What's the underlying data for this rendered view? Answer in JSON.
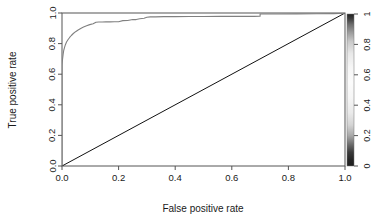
{
  "figure": {
    "kind": "roc-curve-plot",
    "background": "#ffffff",
    "width": 387,
    "height": 221
  },
  "axes": {
    "xlabel": "False positive rate",
    "ylabel": "True positive rate",
    "xticks": [
      "0.0",
      "0.2",
      "0.4",
      "0.6",
      "0.8",
      "1.0"
    ],
    "yticks": [
      "0.0",
      "0.2",
      "0.4",
      "0.6",
      "0.8",
      "1.0"
    ],
    "xlim": [
      0,
      1
    ],
    "ylim": [
      0,
      1
    ],
    "axis_color": "#555555",
    "box": true
  },
  "colorbar": {
    "name": "cutoff-colorbar",
    "ticks": [
      "0",
      "0.2",
      "0.4",
      "0.6",
      "0.8",
      "1"
    ],
    "lim": [
      0,
      1
    ],
    "orientation": "vertical",
    "colormap": "grayscale",
    "dark_color": "#1f1f1f",
    "light_color": "#fcfcfc"
  },
  "chart_data": {
    "type": "line",
    "title": "",
    "subtitle": "",
    "xlabel": "False positive rate",
    "ylabel": "True positive rate",
    "xlim": [
      0,
      1
    ],
    "ylim": [
      0,
      1
    ],
    "grid": false,
    "legend": "none",
    "annotations": [],
    "series": [
      {
        "name": "ROC curve",
        "color_mapped_by": "cutoff",
        "line_color": "#808080",
        "x": [
          0.0,
          0.0,
          0.0,
          0.0,
          0.0,
          0.0,
          0.0,
          0.0,
          0.002,
          0.004,
          0.006,
          0.009,
          0.012,
          0.016,
          0.021,
          0.027,
          0.033,
          0.04,
          0.048,
          0.057,
          0.066,
          0.076,
          0.087,
          0.098,
          0.11,
          0.12,
          0.13,
          0.142,
          0.155,
          0.17,
          0.185,
          0.2,
          0.215,
          0.232,
          0.25,
          0.262,
          0.275,
          0.29,
          0.3,
          0.312,
          0.33,
          0.36,
          0.4,
          0.45,
          0.5,
          0.56,
          0.62,
          0.68,
          0.7,
          0.7,
          0.76,
          0.83,
          0.9,
          0.96,
          1.0,
          1.0
        ],
        "y": [
          0.0,
          0.06,
          0.15,
          0.3,
          0.45,
          0.56,
          0.62,
          0.66,
          0.7,
          0.73,
          0.755,
          0.775,
          0.793,
          0.81,
          0.825,
          0.84,
          0.853,
          0.866,
          0.878,
          0.889,
          0.899,
          0.908,
          0.917,
          0.924,
          0.93,
          0.94,
          0.941,
          0.941,
          0.942,
          0.942,
          0.943,
          0.943,
          0.95,
          0.951,
          0.957,
          0.957,
          0.962,
          0.966,
          0.972,
          0.975,
          0.975,
          0.976,
          0.976,
          0.977,
          0.977,
          0.978,
          0.978,
          0.978,
          0.979,
          0.993,
          0.993,
          0.994,
          0.995,
          0.996,
          0.998,
          1.0
        ]
      },
      {
        "name": "Chance diagonal",
        "line_color": "#111111",
        "x": [
          0.0,
          1.0
        ],
        "y": [
          0.0,
          1.0
        ]
      }
    ]
  }
}
